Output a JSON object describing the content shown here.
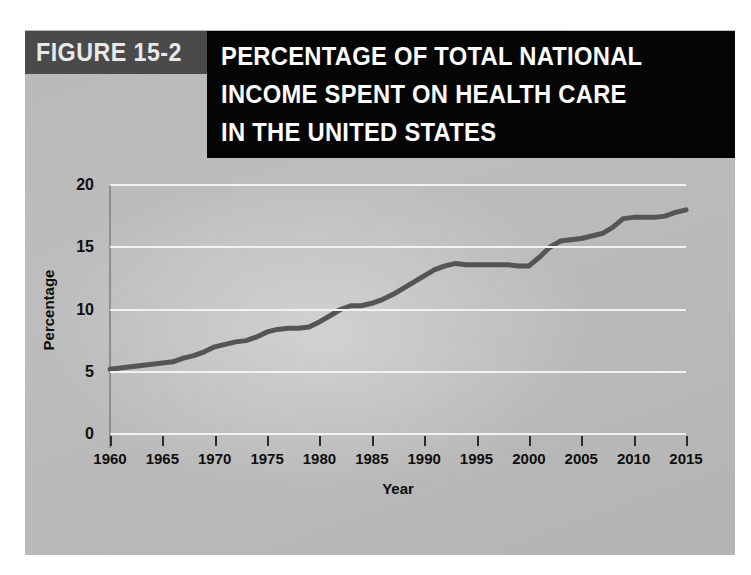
{
  "figure": {
    "tag_label": "FIGURE 15-2",
    "title_lines": [
      "PERCENTAGE OF TOTAL NATIONAL",
      "INCOME SPENT ON HEALTH CARE",
      "IN THE UNITED STATES"
    ]
  },
  "colors": {
    "panel_background": "#bbbbbb",
    "title_block": "#050505",
    "figure_tag_block": "#4a4a4a",
    "title_text": "#fdfdfd",
    "gridline": "#f2f2f2",
    "axis": "#8d8d8d",
    "series_line": "#555555"
  },
  "chart_data": {
    "type": "line",
    "title": "PERCENTAGE OF TOTAL NATIONAL INCOME SPENT ON HEALTH CARE IN THE UNITED STATES",
    "xlabel": "Year",
    "ylabel": "Percentage",
    "xlim": [
      1960,
      2015
    ],
    "ylim": [
      0,
      20
    ],
    "xticks": [
      1960,
      1965,
      1970,
      1975,
      1980,
      1985,
      1990,
      1995,
      2000,
      2005,
      2010,
      2015
    ],
    "xtick_labels": [
      "1960",
      "1965",
      "1970",
      "1975",
      "1980",
      "1985",
      "1990",
      "1995",
      "2000",
      "2005",
      "2010",
      "2015"
    ],
    "yticks": [
      0,
      5,
      10,
      15,
      20
    ],
    "ytick_labels": [
      "0",
      "5",
      "10",
      "15",
      "20"
    ],
    "grid": "horizontal",
    "legend": "none",
    "series": [
      {
        "name": "Health care share of national income",
        "units": "percent",
        "x": [
          1960,
          1961,
          1962,
          1963,
          1964,
          1965,
          1966,
          1967,
          1968,
          1969,
          1970,
          1971,
          1972,
          1973,
          1974,
          1975,
          1976,
          1977,
          1978,
          1979,
          1980,
          1981,
          1982,
          1983,
          1984,
          1985,
          1986,
          1987,
          1988,
          1989,
          1990,
          1991,
          1992,
          1993,
          1994,
          1995,
          1996,
          1997,
          1998,
          1999,
          2000,
          2001,
          2002,
          2003,
          2004,
          2005,
          2006,
          2007,
          2008,
          2009,
          2010,
          2011,
          2012,
          2013,
          2014,
          2015
        ],
        "values": [
          5.2,
          5.3,
          5.4,
          5.5,
          5.6,
          5.7,
          5.8,
          6.1,
          6.3,
          6.6,
          7.0,
          7.2,
          7.4,
          7.5,
          7.8,
          8.2,
          8.4,
          8.5,
          8.5,
          8.6,
          9.0,
          9.5,
          10.0,
          10.3,
          10.3,
          10.5,
          10.8,
          11.2,
          11.7,
          12.2,
          12.7,
          13.2,
          13.5,
          13.7,
          13.6,
          13.6,
          13.6,
          13.6,
          13.6,
          13.5,
          13.5,
          14.2,
          15.0,
          15.5,
          15.6,
          15.7,
          15.9,
          16.1,
          16.6,
          17.3,
          17.4,
          17.4,
          17.4,
          17.5,
          17.8,
          18.0
        ]
      }
    ]
  }
}
